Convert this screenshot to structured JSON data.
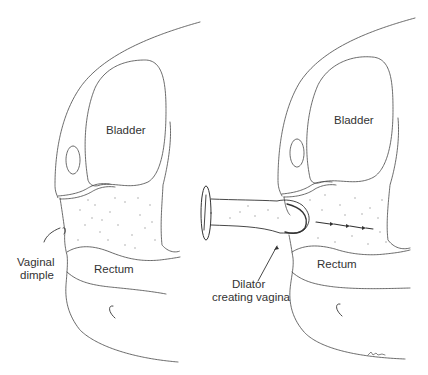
{
  "figure": {
    "panels": [
      {
        "id": "left",
        "labels": {
          "bladder": "Bladder",
          "rectum": "Rectum",
          "vaginal_dimple_line1": "Vaginal",
          "vaginal_dimple_line2": "dimple"
        }
      },
      {
        "id": "right",
        "labels": {
          "bladder": "Bladder",
          "rectum": "Rectum",
          "dilator_line1": "Dilator",
          "dilator_line2": "creating vagina"
        }
      }
    ],
    "colors": {
      "line": "#333333",
      "text": "#333333",
      "background": "#ffffff",
      "stipple": "#9a9a9a"
    }
  }
}
